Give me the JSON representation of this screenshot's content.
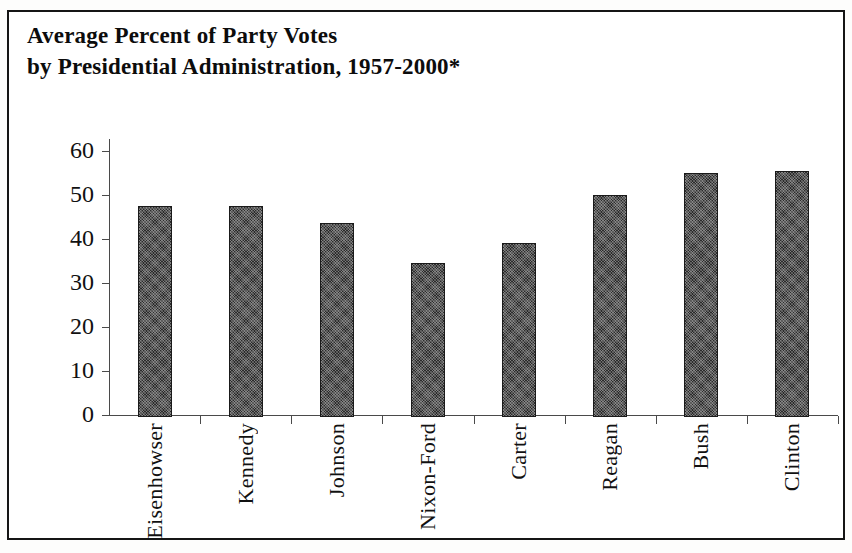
{
  "figure": {
    "title_line_1": "Average Percent of Party Votes",
    "title_line_2": "by Presidential Administration, 1957-2000*"
  },
  "chart_data": {
    "type": "bar",
    "title": "Average Percent of Party Votes by Presidential Administration, 1957-2000*",
    "xlabel": "",
    "ylabel": "",
    "ylim": [
      0,
      60
    ],
    "yticks": [
      0,
      10,
      20,
      30,
      40,
      50,
      60
    ],
    "ytick_labels": [
      "0",
      "10",
      "20",
      "30",
      "40",
      "50",
      "60"
    ],
    "grid": false,
    "legend": false,
    "categories": [
      "Eisenhowser",
      "Kennedy",
      "Johnson",
      "Nixon-Ford",
      "Carter",
      "Reagan",
      "Bush",
      "Clinton"
    ],
    "values": [
      48,
      48,
      44,
      35,
      39.5,
      50.5,
      55.5,
      56
    ],
    "bar_color": "#2b2b2b"
  }
}
